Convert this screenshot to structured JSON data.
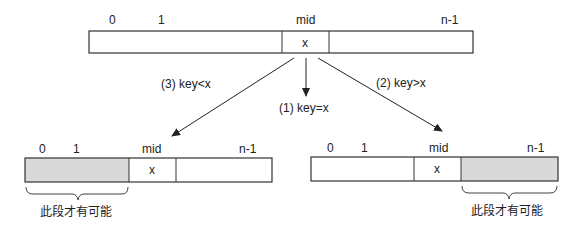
{
  "top_array": {
    "labels": {
      "i0": "0",
      "i1": "1",
      "mid": "mid",
      "last": "n-1"
    },
    "mid_value": "x"
  },
  "branches": {
    "equal": "(1) key=x",
    "greater": "(2) key>x",
    "less": "(3) key<x"
  },
  "left_array": {
    "labels": {
      "i0": "0",
      "i1": "1",
      "mid": "mid",
      "last": "n-1"
    },
    "mid_value": "x",
    "brace_text": "此段才有可能"
  },
  "right_array": {
    "labels": {
      "i0": "0",
      "i1": "1",
      "mid": "mid",
      "last": "n-1"
    },
    "mid_value": "x",
    "brace_text": "此段才有可能"
  },
  "colors": {
    "shade": "#d9d9d9",
    "stroke": "#333333"
  }
}
